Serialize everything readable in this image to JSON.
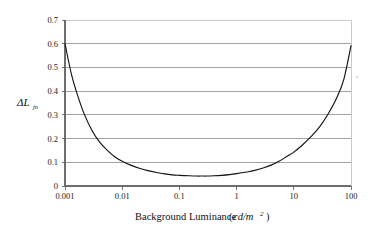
{
  "chart_data": {
    "type": "line",
    "title": "",
    "subtitle": "",
    "xlabel": "Background Luminance (cd/m 2 )",
    "xlabel_text": "Background Luminance",
    "xlabel_units_italic": "cd/m",
    "xlabel_units_exponent": "2",
    "ylabel": "ΔL jn",
    "ylabel_main": "ΔL",
    "ylabel_subscript": "jn",
    "xscale": "log",
    "yscale": "linear",
    "xlim": [
      0.001,
      100
    ],
    "ylim": [
      0,
      0.7
    ],
    "xticks": [
      0.001,
      0.01,
      0.1,
      1,
      10,
      100
    ],
    "xticklabels": [
      "0.001",
      "0.01",
      "0.1",
      "1",
      "10",
      "100"
    ],
    "yticks": [
      0,
      0.1,
      0.2,
      0.3,
      0.4,
      0.5,
      0.6,
      0.7
    ],
    "yticklabels": [
      "0",
      "0.1",
      "0.2",
      "0.3",
      "0.4",
      "0.5",
      "0.6",
      "0.7"
    ],
    "grid": "horizontal",
    "legend": "none",
    "series": [
      {
        "name": "Threshold contrast",
        "x": [
          0.001,
          0.0013,
          0.0017,
          0.0022,
          0.003,
          0.004,
          0.0055,
          0.0075,
          0.01,
          0.014,
          0.02,
          0.028,
          0.04,
          0.055,
          0.075,
          0.1,
          0.15,
          0.2,
          0.25,
          0.3,
          0.4,
          0.55,
          0.75,
          1,
          1.5,
          2,
          3,
          4,
          5.5,
          7.5,
          10,
          14,
          20,
          28,
          40,
          55,
          75,
          100
        ],
        "y": [
          0.6,
          0.47,
          0.375,
          0.3,
          0.232,
          0.186,
          0.15,
          0.122,
          0.104,
          0.088,
          0.075,
          0.065,
          0.057,
          0.051,
          0.047,
          0.045,
          0.043,
          0.042,
          0.042,
          0.042,
          0.043,
          0.045,
          0.048,
          0.052,
          0.059,
          0.065,
          0.077,
          0.088,
          0.104,
          0.124,
          0.143,
          0.172,
          0.208,
          0.248,
          0.305,
          0.367,
          0.45,
          0.592
        ]
      }
    ]
  },
  "axes": {
    "y_axis_name": "delta-L-jnd-axis",
    "x_axis_name": "background-luminance-axis"
  }
}
